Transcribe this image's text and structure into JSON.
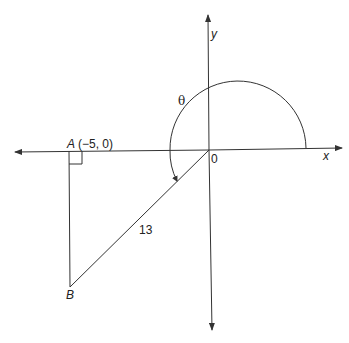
{
  "diagram": {
    "axes": {
      "x_label": "x",
      "y_label": "y",
      "origin_label": "0"
    },
    "points": {
      "A": {
        "name": "A",
        "coords": "(−5, 0)"
      },
      "B": {
        "name": "B"
      }
    },
    "hypotenuse_label": "13",
    "angle_label": "θ",
    "colors": {
      "stroke": "#333333",
      "background": "#ffffff"
    }
  }
}
